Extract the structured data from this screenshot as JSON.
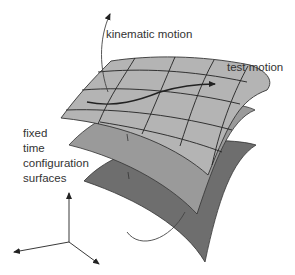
{
  "labels": {
    "kinematic_motion": "kinematic motion",
    "test_motion": "test motion",
    "surfaces_line1": "fixed",
    "surfaces_line2": "time",
    "surfaces_line3": "configuration",
    "surfaces_line4": "surfaces"
  },
  "colors": {
    "top_surface": "#b4b4b4",
    "middle_surface": "#9a9a9a",
    "bottom_surface": "#6e6e6e",
    "outline": "#333333",
    "text": "#333333"
  },
  "surfaces": [
    {
      "name": "top",
      "grid": true
    },
    {
      "name": "middle",
      "grid": false
    },
    {
      "name": "bottom",
      "grid": false
    }
  ],
  "axes": {
    "count": 3
  }
}
